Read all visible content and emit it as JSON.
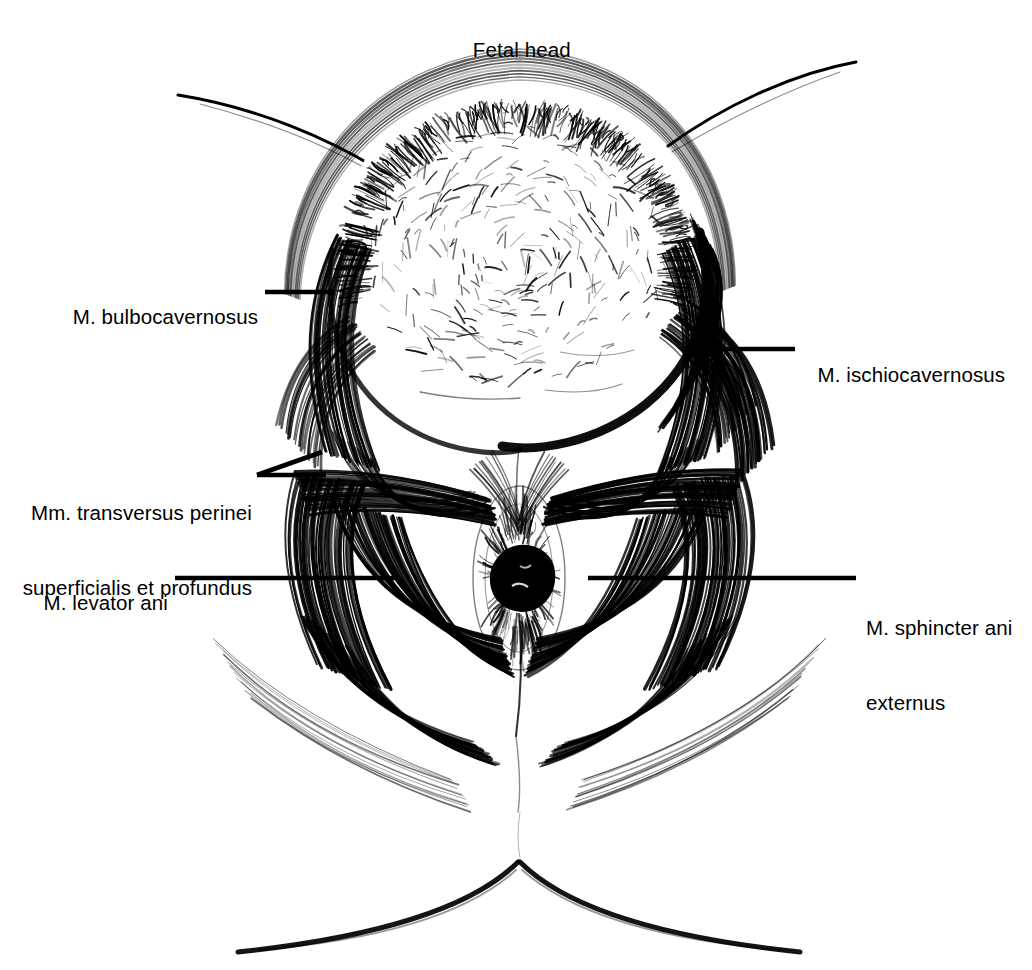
{
  "figure": {
    "title": "Fetal head",
    "kind": "anatomical-line-drawing",
    "view": "lithotomy / perineal view",
    "style": "black-and-white pen-and-ink hatching",
    "background_color": "#ffffff",
    "ink_color": "#000000"
  },
  "labels": [
    {
      "id": "fetal-head",
      "text": "Fetal head",
      "side": "top",
      "x": 516,
      "y": 25,
      "leader": null
    },
    {
      "id": "m-bulbocavernosus",
      "text": "M. bulbocavernosus",
      "side": "left",
      "x": 258,
      "y": 292,
      "leader": {
        "type": "line",
        "x1": 265,
        "y1": 292,
        "x2": 334,
        "y2": 292
      }
    },
    {
      "id": "mm-transversus-perinei",
      "text": "Mm. transversus perinei\nsuperficialis et profundus",
      "line1": "Mm. transversus perinei",
      "line2": "superficialis et profundus",
      "side": "left",
      "x": 252,
      "y": 475,
      "leader": {
        "type": "fork",
        "x1": 257,
        "y1": 475,
        "x2": 326,
        "y2": 475,
        "x3": 322,
        "y3": 452
      }
    },
    {
      "id": "m-levator-ani",
      "text": "M. levator ani",
      "side": "left",
      "x": 168,
      "y": 578,
      "leader": {
        "type": "line",
        "x1": 175,
        "y1": 578,
        "x2": 398,
        "y2": 578
      }
    },
    {
      "id": "m-ischiocavernosus",
      "text": "M. ischiocavernosus",
      "side": "right",
      "x": 806,
      "y": 350,
      "leader": {
        "type": "line",
        "x1": 713,
        "y1": 349,
        "x2": 795,
        "y2": 349
      }
    },
    {
      "id": "m-sphincter-ani-externus",
      "text": "M. sphincter ani\nexternus",
      "line1": "M. sphincter ani",
      "line2": "externus",
      "side": "right",
      "x": 866,
      "y": 578,
      "leader": {
        "type": "line",
        "x1": 588,
        "y1": 578,
        "x2": 856,
        "y2": 578
      }
    }
  ],
  "structures": [
    {
      "id": "fetal-head",
      "name": "Fetal head",
      "note": "crowning, hair-stippled vertex"
    },
    {
      "id": "vulvar-ring",
      "name": "Stretched vulvar ring",
      "note": "dark band encircling the head"
    },
    {
      "id": "bulbocavernosus-left",
      "name": "M. bulbocavernosus (left)"
    },
    {
      "id": "bulbocavernosus-right",
      "name": "M. bulbocavernosus (right)"
    },
    {
      "id": "ischiocavernosus-left",
      "name": "M. ischiocavernosus (left)"
    },
    {
      "id": "ischiocavernosus-right",
      "name": "M. ischiocavernosus (right)"
    },
    {
      "id": "transversus-perinei-left",
      "name": "Mm. transversus perinei (left)"
    },
    {
      "id": "transversus-perinei-right",
      "name": "Mm. transversus perinei (right)"
    },
    {
      "id": "levator-ani-left",
      "name": "M. levator ani (left)"
    },
    {
      "id": "levator-ani-right",
      "name": "M. levator ani (right)"
    },
    {
      "id": "sphincter-ani-externus",
      "name": "M. sphincter ani externus"
    },
    {
      "id": "anus",
      "name": "Anus"
    },
    {
      "id": "perineal-body",
      "name": "Perineal body / raphe"
    },
    {
      "id": "gluteal-cleft",
      "name": "Gluteal cleft"
    },
    {
      "id": "thigh-contour-left",
      "name": "Left thigh / inguinal contour"
    },
    {
      "id": "thigh-contour-right",
      "name": "Right thigh / inguinal contour"
    }
  ]
}
